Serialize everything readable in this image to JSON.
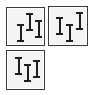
{
  "palette": {
    "border": "#3a3a3a",
    "fill": "#f4f4f4",
    "glyph": "#1e1e1e"
  },
  "tiles": [
    {
      "name": "align-variant-1",
      "x": 6,
      "y": 7,
      "w": 39,
      "h": 39,
      "bars": [
        {
          "x": 10,
          "y": 16,
          "h": 18
        },
        {
          "x": 19,
          "y": 5,
          "h": 18
        },
        {
          "x": 28,
          "y": 12,
          "h": 18
        }
      ]
    },
    {
      "name": "align-variant-2",
      "x": 48,
      "y": 6,
      "w": 40,
      "h": 40,
      "bars": [
        {
          "x": 7,
          "y": 10,
          "h": 18
        },
        {
          "x": 17,
          "y": 17,
          "h": 18
        },
        {
          "x": 27,
          "y": 5,
          "h": 18
        }
      ]
    },
    {
      "name": "align-variant-3",
      "x": 6,
      "y": 50,
      "w": 39,
      "h": 40,
      "bars": [
        {
          "x": 8,
          "y": 6,
          "h": 18
        },
        {
          "x": 17,
          "y": 13,
          "h": 18
        },
        {
          "x": 26,
          "y": 9,
          "h": 18
        }
      ]
    }
  ]
}
